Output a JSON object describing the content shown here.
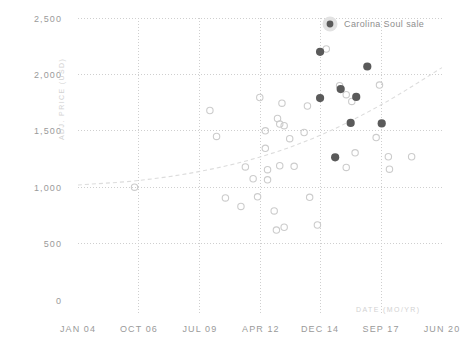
{
  "chart_data": {
    "type": "scatter",
    "title": "",
    "xlabel": "DATE (MO/YR)",
    "ylabel": "ADJ. PRICE (USD)",
    "xtick_labels": [
      "JAN 04",
      "OCT 06",
      "JUL 09",
      "APR 12",
      "DEC 14",
      "SEP 17",
      "JUN 20"
    ],
    "ytick_labels": [
      "0",
      "500",
      "1,000",
      "1,500",
      "2,000",
      "2,500"
    ],
    "ytick_values": [
      0,
      500,
      1000,
      1500,
      2000,
      2500
    ],
    "ylim": [
      0,
      2500
    ],
    "xlim": [
      2004.0,
      2020.42
    ],
    "xtick_values": [
      2004.0,
      2006.75,
      2009.5,
      2012.25,
      2014.92,
      2017.67,
      2020.42
    ],
    "grid": true,
    "legend_position": "top-right",
    "series": [
      {
        "name": "Carolina Soul sale",
        "marker": "filled-circle",
        "color": "#5a5a5a",
        "points": [
          {
            "x": 2014.92,
            "y": 2200
          },
          {
            "x": 2017.05,
            "y": 2070
          },
          {
            "x": 2014.92,
            "y": 1790
          },
          {
            "x": 2015.85,
            "y": 1870
          },
          {
            "x": 2016.55,
            "y": 1800
          },
          {
            "x": 2016.3,
            "y": 1570
          },
          {
            "x": 2017.7,
            "y": 1565
          },
          {
            "x": 2015.6,
            "y": 1265
          }
        ]
      },
      {
        "name": "Other sale",
        "marker": "open-circle",
        "color": "#cccccc",
        "points": [
          {
            "x": 2006.55,
            "y": 1000
          },
          {
            "x": 2009.95,
            "y": 1680
          },
          {
            "x": 2012.2,
            "y": 1795
          },
          {
            "x": 2012.45,
            "y": 1500
          },
          {
            "x": 2012.45,
            "y": 1345
          },
          {
            "x": 2013.0,
            "y": 1610
          },
          {
            "x": 2013.1,
            "y": 1560
          },
          {
            "x": 2013.3,
            "y": 1545
          },
          {
            "x": 2013.2,
            "y": 1745
          },
          {
            "x": 2013.55,
            "y": 1430
          },
          {
            "x": 2014.2,
            "y": 1485
          },
          {
            "x": 2014.35,
            "y": 1720
          },
          {
            "x": 2015.2,
            "y": 2225
          },
          {
            "x": 2015.8,
            "y": 1900
          },
          {
            "x": 2016.1,
            "y": 1820
          },
          {
            "x": 2016.35,
            "y": 1760
          },
          {
            "x": 2017.6,
            "y": 1905
          },
          {
            "x": 2017.45,
            "y": 1440
          },
          {
            "x": 2018.0,
            "y": 1270
          },
          {
            "x": 2018.05,
            "y": 1160
          },
          {
            "x": 2016.5,
            "y": 1305
          },
          {
            "x": 2016.1,
            "y": 1175
          },
          {
            "x": 2011.55,
            "y": 1180
          },
          {
            "x": 2011.9,
            "y": 1075
          },
          {
            "x": 2012.55,
            "y": 1155
          },
          {
            "x": 2012.55,
            "y": 1065
          },
          {
            "x": 2013.1,
            "y": 1190
          },
          {
            "x": 2013.75,
            "y": 1185
          },
          {
            "x": 2014.45,
            "y": 910
          },
          {
            "x": 2012.1,
            "y": 915
          },
          {
            "x": 2010.65,
            "y": 905
          },
          {
            "x": 2011.35,
            "y": 830
          },
          {
            "x": 2012.85,
            "y": 790
          },
          {
            "x": 2013.3,
            "y": 645
          },
          {
            "x": 2012.95,
            "y": 620
          },
          {
            "x": 2014.8,
            "y": 665
          },
          {
            "x": 2019.05,
            "y": 1270
          },
          {
            "x": 2010.25,
            "y": 1450
          }
        ]
      }
    ],
    "trendline": {
      "style": "dashed",
      "color": "#dcdcdc",
      "points": [
        {
          "x": 2004.0,
          "y": 1020
        },
        {
          "x": 2006.75,
          "y": 1060
        },
        {
          "x": 2009.5,
          "y": 1140
        },
        {
          "x": 2012.25,
          "y": 1270
        },
        {
          "x": 2014.92,
          "y": 1460
        },
        {
          "x": 2017.67,
          "y": 1730
        },
        {
          "x": 2020.42,
          "y": 2060
        }
      ]
    }
  },
  "legend": {
    "items": [
      {
        "label": "Carolina Soul sale",
        "marker": "filled-circle",
        "color": "#5a5a5a"
      }
    ]
  },
  "caption": {
    "text": ""
  },
  "colors": {
    "grid": "#cfcfcf",
    "tick_text": "#9a9a9a",
    "axis_title": "#d2d2d2",
    "highlight": "#5a5a5a",
    "open_marker": "#cccccc",
    "trend": "#dcdcdc",
    "background": "#ffffff"
  }
}
